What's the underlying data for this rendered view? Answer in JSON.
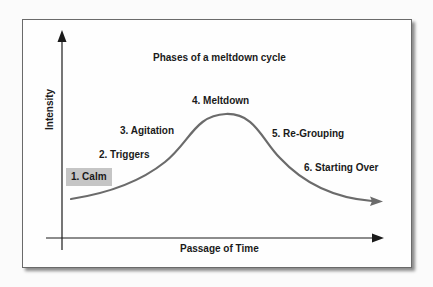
{
  "diagram": {
    "title": "Phases of a meltdown cycle",
    "y_axis_label": "Intensity",
    "x_axis_label": "Passage of Time",
    "phases": [
      {
        "label": "1. Calm",
        "highlighted": true
      },
      {
        "label": "2. Triggers"
      },
      {
        "label": "3. Agitation"
      },
      {
        "label": "4. Meltdown"
      },
      {
        "label": "5. Re-Grouping"
      },
      {
        "label": "6. Starting Over"
      }
    ],
    "colors": {
      "curve": "#6b6b6b",
      "axis": "#1a1a1a",
      "highlight": "#c5c5c5"
    }
  }
}
